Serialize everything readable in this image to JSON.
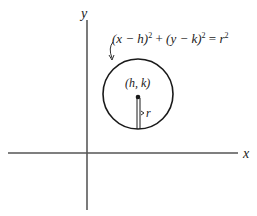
{
  "figure": {
    "axes": {
      "x_label": "x",
      "y_label": "y"
    },
    "circle": {
      "equation": {
        "lhs_1": "(x − h)",
        "exp_1": "2",
        "plus": " + ",
        "lhs_2": "(y − k)",
        "exp_2": "2",
        "equals": " = ",
        "rhs": "r",
        "exp_3": "2"
      },
      "center_label": "(h, k)",
      "radius_label": "r"
    },
    "colors": {
      "stroke": "#1a1a1a",
      "axis": "#555555",
      "background": "#ffffff"
    }
  }
}
